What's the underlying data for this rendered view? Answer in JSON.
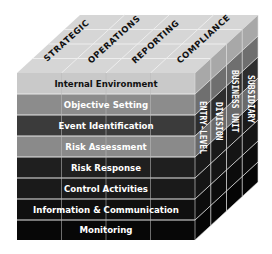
{
  "diagram": {
    "top_face": {
      "objectives": [
        {
          "label": "STRATEGIC"
        },
        {
          "label": "OPERATIONS"
        },
        {
          "label": "REPORTING"
        },
        {
          "label": "COMPLIANCE"
        }
      ]
    },
    "front_face": {
      "components": [
        {
          "label": "Internal Environment",
          "fill": "#c9c9c9",
          "text_color": "#111111"
        },
        {
          "label": "Objective Setting",
          "fill": "#8c8c8c",
          "text_color": "#ffffff"
        },
        {
          "label": "Event Identification",
          "fill": "#3b3b3b",
          "text_color": "#ffffff"
        },
        {
          "label": "Risk Assessment",
          "fill": "#8a8a8a",
          "text_color": "#ffffff"
        },
        {
          "label": "Risk Response",
          "fill": "#1f1f1f",
          "text_color": "#ffffff"
        },
        {
          "label": "Control Activities",
          "fill": "#1a1a1a",
          "text_color": "#ffffff"
        },
        {
          "label": "Information & Communication",
          "fill": "#0f0f0f",
          "text_color": "#ffffff"
        },
        {
          "label": "Monitoring",
          "fill": "#070707",
          "text_color": "#ffffff"
        }
      ]
    },
    "side_face": {
      "levels": [
        {
          "label": "ENTRY-LEVEL"
        },
        {
          "label": "DIVISION"
        },
        {
          "label": "BUSINESS UNIT"
        },
        {
          "label": "SUBSIDIARY"
        }
      ]
    },
    "colors": {
      "top_face": "#d9d9d9",
      "grid_line": "#e6e6e6",
      "background": "#ffffff"
    }
  }
}
